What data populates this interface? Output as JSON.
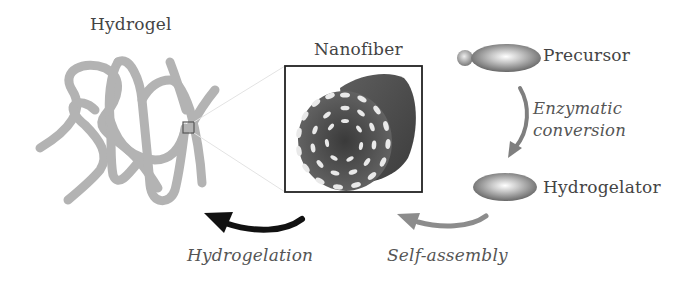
{
  "diagram": {
    "nodes": {
      "hydrogel": {
        "label": "Hydrogel"
      },
      "nanofiber": {
        "label": "Nanofiber"
      },
      "precursor": {
        "label": "Precursor"
      },
      "hydrogelator": {
        "label": "Hydrogelator"
      }
    },
    "edges": {
      "enzymatic": {
        "label_line1": "Enzymatic",
        "label_line2": "conversion",
        "from": "Precursor",
        "to": "Hydrogelator"
      },
      "self_assembly": {
        "label": "Self-assembly",
        "from": "Hydrogelator",
        "to": "Nanofiber"
      },
      "hydrogelation": {
        "label": "Hydrogelation",
        "from": "Nanofiber",
        "to": "Hydrogel"
      }
    },
    "colors": {
      "gel_strand": "#b0b0b0",
      "fiber_body": "#555555",
      "fiber_dots": "#e8e8e8",
      "molecule": "#7a7a7a",
      "arrow_dark": "#111111",
      "arrow_gray": "#8a8a8a",
      "text": "#444444"
    }
  }
}
